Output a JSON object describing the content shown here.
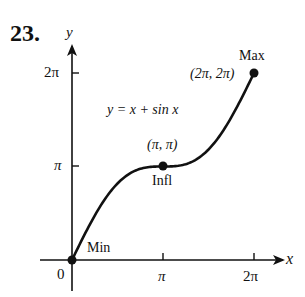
{
  "problem_number": "23.",
  "chart_data": {
    "type": "line",
    "title": "",
    "equation_label": "y = x + sin x",
    "function": "x + sin(x)",
    "xlabel": "x",
    "ylabel": "y",
    "xlim": [
      0,
      6.2832
    ],
    "ylim": [
      0,
      6.2832
    ],
    "grid": false,
    "legend": "none",
    "x_ticks": [
      {
        "value": 3.14159,
        "label": "π"
      },
      {
        "value": 6.28319,
        "label": "2π"
      }
    ],
    "y_ticks": [
      {
        "value": 3.14159,
        "label": "π"
      },
      {
        "value": 6.28319,
        "label": "2π"
      }
    ],
    "origin_label": "0",
    "series": [
      {
        "name": "y = x + sin x",
        "x": [
          0,
          0.5236,
          1.0472,
          1.5708,
          2.0944,
          2.618,
          3.1416,
          3.6652,
          4.1888,
          4.7124,
          5.236,
          5.7596,
          6.2832
        ],
        "y": [
          0,
          1.0236,
          1.9132,
          2.5708,
          2.9604,
          3.118,
          3.1416,
          3.1652,
          3.3228,
          3.7124,
          4.37,
          5.2596,
          6.2832
        ]
      }
    ],
    "points": [
      {
        "name": "min",
        "x": 0,
        "y": 0,
        "label": "Min",
        "coord_label": ""
      },
      {
        "name": "inflection",
        "x": 3.14159,
        "y": 3.14159,
        "label": "Infl",
        "coord_label": "(π, π)"
      },
      {
        "name": "max",
        "x": 6.28319,
        "y": 6.28319,
        "label": "Max",
        "coord_label": "(2π, 2π)"
      }
    ]
  },
  "labels": {
    "y_axis": "y",
    "x_axis": "x",
    "equation": "y = x + sin x",
    "y_tick_2pi": "2π",
    "y_tick_pi": "π",
    "x_tick_pi": "π",
    "x_tick_2pi": "2π",
    "origin": "0",
    "min": "Min",
    "infl": "Infl",
    "infl_coord": "(π, π)",
    "max": "Max",
    "max_coord": "(2π, 2π)"
  }
}
